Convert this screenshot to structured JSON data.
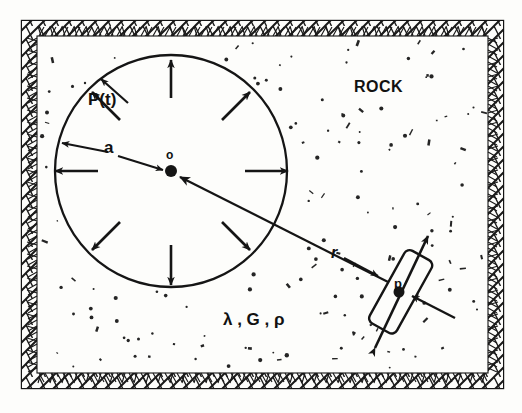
{
  "figure": {
    "medium_label": "ROCK",
    "cavity": {
      "pressure_label": "P(t)",
      "radius_label": "a",
      "center_label": "o",
      "center_x": 171,
      "center_y": 171,
      "radius_px": 116
    },
    "observation": {
      "distance_label": "r",
      "point_label": "p"
    },
    "material_properties_label": "λ , G , ρ",
    "material_properties": [
      "λ",
      "G",
      "ρ"
    ],
    "colors": {
      "ink": "#151515",
      "paper": "#fdfdfb",
      "hatch": "#1a1a1a"
    },
    "pressure_arrow_angles_deg": [
      270,
      315,
      0,
      45,
      90,
      135,
      180,
      225
    ],
    "speck_count": 150
  }
}
